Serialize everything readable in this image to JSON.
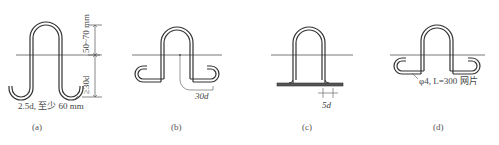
{
  "figures": [
    {
      "id": "a",
      "caption": "(a)",
      "labels": {
        "top_dimension": "50~70 mm",
        "embed_dimension": "≥30d",
        "hook_note": "2.5d, 至少 60 mm"
      }
    },
    {
      "id": "b",
      "caption": "(b)",
      "labels": {
        "hook_dimension": "30d"
      }
    },
    {
      "id": "c",
      "caption": "(c)",
      "labels": {
        "weld_dimension": "5d"
      }
    },
    {
      "id": "d",
      "caption": "(d)",
      "labels": {
        "mesh_note": "φ4, L=300 网片"
      }
    }
  ],
  "colors": {
    "line": "#3a3a3a",
    "background": "#ffffff"
  }
}
